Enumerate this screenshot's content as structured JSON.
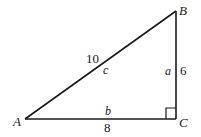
{
  "diagram": {
    "type": "right-triangle",
    "colors": {
      "stroke": "#1a1a1a",
      "background": "#ffffff"
    },
    "vertices": {
      "A": {
        "label": "A",
        "x": 25,
        "y": 119
      },
      "B": {
        "label": "B",
        "x": 176,
        "y": 11
      },
      "C": {
        "label": "C",
        "x": 176,
        "y": 119
      }
    },
    "sides": {
      "hypotenuse": {
        "name": "c",
        "length": "10"
      },
      "vertical": {
        "name": "a",
        "length": "6"
      },
      "base": {
        "name": "b",
        "length": "8"
      }
    },
    "right_angle_at": "C"
  }
}
